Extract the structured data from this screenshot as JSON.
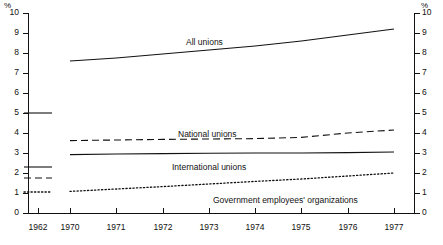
{
  "chart_data": {
    "type": "line",
    "title": "",
    "xlabel": "",
    "ylabel": "%",
    "ylim": [
      0,
      10
    ],
    "ytick_labels": [
      "0",
      "1",
      "2",
      "3",
      "4",
      "5",
      "6",
      "7",
      "8",
      "9",
      "10"
    ],
    "yticks": [
      0,
      1,
      2,
      3,
      4,
      5,
      6,
      7,
      8,
      9,
      10
    ],
    "grid": false,
    "legend_position": "inline-annotations",
    "axis_unit_left": "%",
    "axis_unit_right": "%",
    "categories": [
      "1970",
      "1971",
      "1972",
      "1973",
      "1974",
      "1975",
      "1976",
      "1977"
    ],
    "reference_year": "1962",
    "series": [
      {
        "name": "All unions",
        "style": "solid",
        "values": [
          7.6,
          7.75,
          7.95,
          8.15,
          8.35,
          8.6,
          8.9,
          9.2
        ],
        "value_1962": 5.0
      },
      {
        "name": "National unions",
        "style": "dashed",
        "values": [
          3.62,
          3.65,
          3.68,
          3.7,
          3.72,
          3.78,
          4.0,
          4.15
        ],
        "value_1962": 1.75
      },
      {
        "name": "International unions",
        "style": "solid",
        "values": [
          2.92,
          2.95,
          2.97,
          2.99,
          3.0,
          3.0,
          3.02,
          3.05
        ],
        "value_1962": 2.3
      },
      {
        "name": "Government employees' organizations",
        "style": "dotted",
        "values": [
          1.08,
          1.2,
          1.32,
          1.45,
          1.58,
          1.7,
          1.85,
          2.0
        ],
        "value_1962": 1.05
      }
    ]
  },
  "axes": {
    "left_unit": "%",
    "right_unit": "%",
    "y_labels": [
      "10",
      "9",
      "8",
      "7",
      "6",
      "5",
      "4",
      "3",
      "2",
      "1",
      "0"
    ],
    "x_labels": [
      "1962",
      "1970",
      "1971",
      "1972",
      "1973",
      "1974",
      "1975",
      "1976",
      "1977"
    ]
  },
  "annotations": {
    "all_unions": "All unions",
    "national_unions": "National unions",
    "international_unions": "International unions",
    "government_employees": "Government employees' organizations"
  }
}
